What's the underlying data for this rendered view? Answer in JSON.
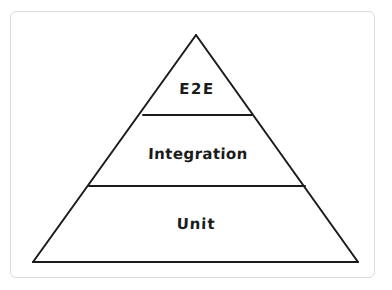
{
  "diagram": {
    "type": "pyramid",
    "canvas": {
      "width": 392,
      "height": 290,
      "background_color": "#ffffff"
    },
    "frame": {
      "border_color": "#dadada",
      "fill_color": "#ffffff",
      "corner_radius": 6
    },
    "stroke_color": "#1b1b1b",
    "stroke_width": 2,
    "text_color": "#1b1b1b",
    "apex": {
      "x": 196,
      "y": 35
    },
    "base_left": {
      "x": 33,
      "y": 262
    },
    "base_right": {
      "x": 358,
      "y": 262
    },
    "tiers": [
      {
        "id": "e2e",
        "label": "E2E",
        "level": 1,
        "position": "top",
        "divider_y": 115,
        "divider_x_start": 143,
        "divider_x_end": 252,
        "label_x": 197,
        "label_y": 89
      },
      {
        "id": "integration",
        "label": "Integration",
        "level": 2,
        "position": "middle",
        "divider_y": 186,
        "divider_x_start": 89,
        "divider_x_end": 305,
        "label_x": 198,
        "label_y": 154
      },
      {
        "id": "unit",
        "label": "Unit",
        "level": 3,
        "position": "bottom",
        "divider_y": 262,
        "divider_x_start": 33,
        "divider_x_end": 358,
        "label_x": 196,
        "label_y": 224
      }
    ]
  }
}
